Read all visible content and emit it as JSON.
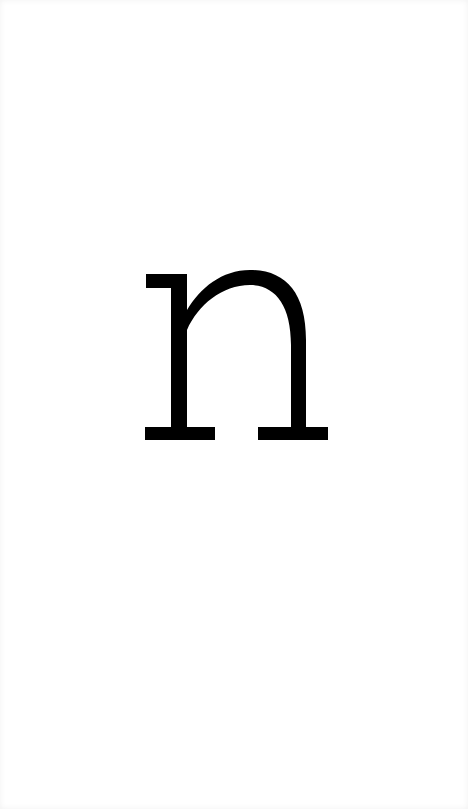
{
  "card": {
    "letter": "n",
    "style": "slab-serif lowercase",
    "colors": {
      "background": "#ffffff",
      "glyph": "#000000"
    }
  }
}
